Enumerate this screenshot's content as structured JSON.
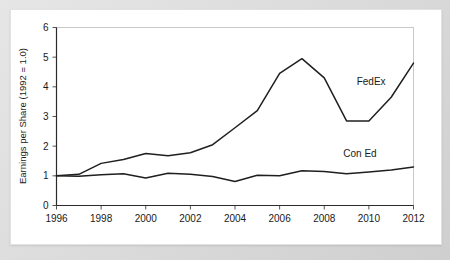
{
  "chart_data": {
    "type": "line",
    "title": "",
    "xlabel": "",
    "ylabel": "Earnings per Share (1992 = 1.0)",
    "xlim": [
      1996,
      2012
    ],
    "ylim": [
      0,
      6
    ],
    "yticks": [
      0,
      1,
      2,
      3,
      4,
      5,
      6
    ],
    "xticks": [
      1996,
      1998,
      2000,
      2002,
      2004,
      2006,
      2008,
      2010,
      2012
    ],
    "grid": false,
    "legend_position": "inline-annotation",
    "x": [
      1996,
      1997,
      1998,
      1999,
      2000,
      2001,
      2002,
      2003,
      2004,
      2005,
      2006,
      2007,
      2008,
      2009,
      2010,
      2011,
      2012
    ],
    "series": [
      {
        "name": "FedEx",
        "label_x": 2010.1,
        "label_y": 4.05,
        "values": [
          1.0,
          1.05,
          1.42,
          1.55,
          1.75,
          1.68,
          1.78,
          2.05,
          2.62,
          3.2,
          4.45,
          4.95,
          4.3,
          2.85,
          2.85,
          3.65,
          4.8
        ]
      },
      {
        "name": "Con Ed",
        "label_x": 2009.6,
        "label_y": 1.63,
        "values": [
          1.0,
          0.99,
          1.04,
          1.07,
          0.93,
          1.09,
          1.05,
          0.98,
          0.81,
          1.02,
          1.0,
          1.17,
          1.15,
          1.07,
          1.13,
          1.2,
          1.3
        ]
      }
    ]
  },
  "axis": {
    "ylabel_text": "Earnings per Share (1992 = 1.0)",
    "ytick_labels": [
      "0",
      "1",
      "2",
      "3",
      "4",
      "5",
      "6"
    ],
    "xtick_labels": [
      "1996",
      "1998",
      "2000",
      "2002",
      "2004",
      "2006",
      "2008",
      "2010",
      "2012"
    ]
  },
  "series_labels": {
    "fedex": "FedEx",
    "coned": "Con Ed"
  },
  "colors": {
    "line": "#1f1f1f",
    "axis": "#2b2b2b",
    "frame": "#c8c8c8",
    "card": "#ffffff",
    "page": "#dcdcdc"
  }
}
